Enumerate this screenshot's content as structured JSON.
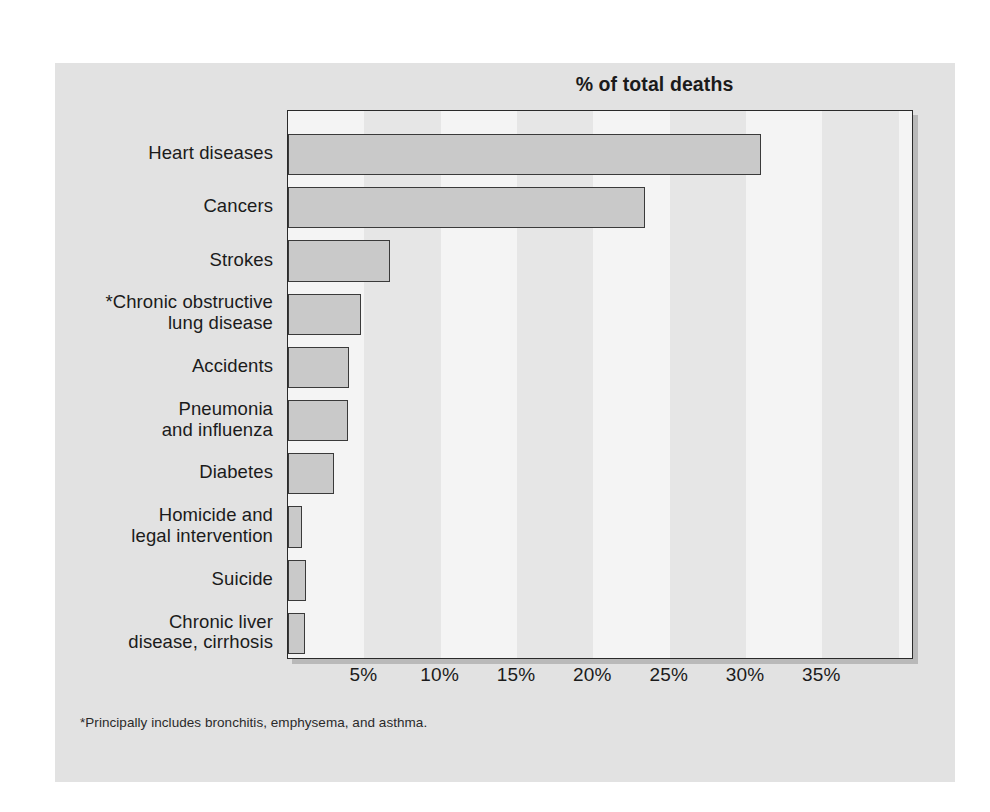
{
  "figure": {
    "title": "% of total deaths",
    "footnote": "*Principally includes bronchitis, emphysema, and asthma.",
    "background_color": "#e2e2e2",
    "plot_background_color": "#f4f4f4",
    "band_color": "#e6e6e6",
    "bar_fill_color": "#c9c9c9",
    "bar_border_color": "#3a3a3a",
    "text_color": "#1b1b1b"
  },
  "chart_data": {
    "type": "bar",
    "orientation": "horizontal",
    "title": "% of total deaths",
    "xlabel": "",
    "ylabel": "",
    "xlim": [
      0,
      41
    ],
    "grid": false,
    "legend": null,
    "tick_format": "percent",
    "xticks": [
      5,
      10,
      15,
      20,
      25,
      30,
      35
    ],
    "xtick_labels": [
      "5%",
      "10%",
      "15%",
      "20%",
      "25%",
      "30%",
      "35%"
    ],
    "categories": [
      "Heart diseases",
      "Cancers",
      "Strokes",
      "*Chronic obstructive\nlung disease",
      "Accidents",
      "Pneumonia\nand influenza",
      "Diabetes",
      "Homicide and\nlegal intervention",
      "Suicide",
      "Chronic liver\ndisease, cirrhosis"
    ],
    "values": [
      31.0,
      23.4,
      6.7,
      4.8,
      4.0,
      3.9,
      3.0,
      0.9,
      1.2,
      1.1
    ],
    "annotations": [
      "*Principally includes bronchitis, emphysema, and asthma."
    ]
  },
  "ylabels": [
    {
      "lines": [
        "Heart diseases"
      ]
    },
    {
      "lines": [
        "Cancers"
      ]
    },
    {
      "lines": [
        "Strokes"
      ]
    },
    {
      "lines": [
        "*Chronic obstructive",
        "lung disease"
      ]
    },
    {
      "lines": [
        "Accidents"
      ]
    },
    {
      "lines": [
        "Pneumonia",
        "and influenza"
      ]
    },
    {
      "lines": [
        "Diabetes"
      ]
    },
    {
      "lines": [
        "Homicide and",
        "legal intervention"
      ]
    },
    {
      "lines": [
        "Suicide"
      ]
    },
    {
      "lines": [
        "Chronic liver",
        "disease, cirrhosis"
      ]
    }
  ]
}
